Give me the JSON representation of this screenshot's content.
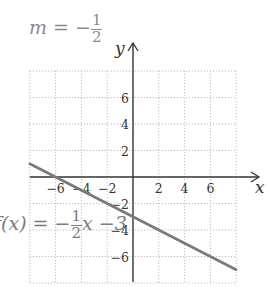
{
  "chart_data": {
    "type": "line",
    "xlabel": "x",
    "ylabel": "y",
    "xlim": [
      -8,
      8
    ],
    "ylim": [
      -8,
      8
    ],
    "grid": true,
    "grid_style": "dotted",
    "x_ticks": [
      -6,
      -4,
      -2,
      2,
      4,
      6
    ],
    "y_ticks": [
      6,
      4,
      2,
      -2,
      -4,
      -6
    ],
    "series": [
      {
        "name": "f(x) = -1/2 x - 3",
        "slope": -0.5,
        "intercept": -3,
        "x": [
          -8,
          8
        ],
        "y": [
          1,
          -7
        ],
        "color": "#7a7a7a"
      }
    ],
    "annotations": [
      {
        "text": "m = -1/2",
        "position": "top-left"
      },
      {
        "text": "f(x) = -1/2 x - 3",
        "position": "left, near y = -3"
      }
    ]
  },
  "labels": {
    "slope_prefix": "m = −",
    "slope_num": "1",
    "slope_den": "2",
    "equation_prefix": "f(x) = −",
    "equation_num": "1",
    "equation_den": "2",
    "equation_suffix": "x −3",
    "x_axis": "x",
    "y_axis": "y"
  },
  "colors": {
    "axis": "#333333",
    "grid": "#bdbdbd",
    "line": "#7a7a7a",
    "annotation": "#8a8a8a"
  }
}
